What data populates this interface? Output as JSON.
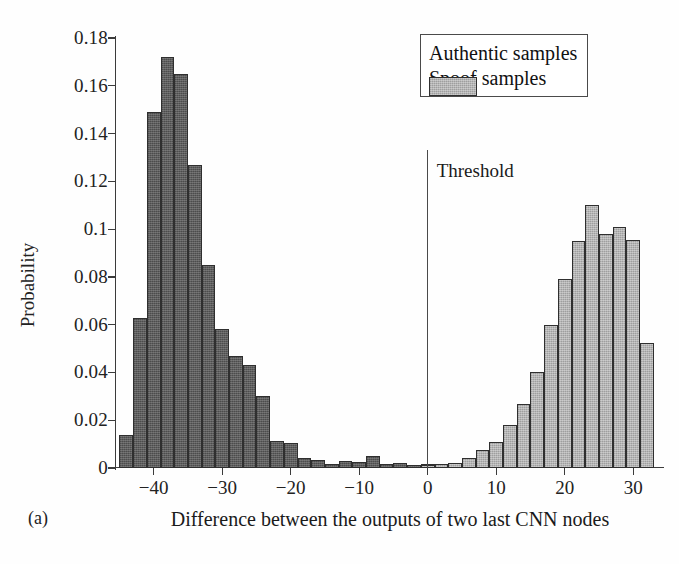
{
  "figure": {
    "panel_tag": "(a)",
    "xlabel": "Difference between the outputs of two last CNN nodes",
    "ylabel": "Probability",
    "threshold_label": "Threshold"
  },
  "legend": {
    "position": "top-right",
    "entries": [
      {
        "label": "Authentic samples",
        "color": "#5d5d5d"
      },
      {
        "label": "Spoof samples",
        "color": "#b4b4b4"
      }
    ]
  },
  "axes": {
    "x_ticks": [
      "−40",
      "−30",
      "−20",
      "−10",
      "0",
      "10",
      "20",
      "30"
    ],
    "x_tick_values": [
      -40,
      -30,
      -20,
      -10,
      0,
      10,
      20,
      30
    ],
    "y_ticks": [
      "0",
      "0.02",
      "0.04",
      "0.06",
      "0.08",
      "0.1",
      "0.12",
      "0.14",
      "0.16",
      "0.18"
    ],
    "y_tick_values": [
      0,
      0.02,
      0.04,
      0.06,
      0.08,
      0.1,
      0.12,
      0.14,
      0.16,
      0.18
    ],
    "xlim": [
      -45.5,
      34.5
    ],
    "ylim": [
      0,
      0.18
    ],
    "grid": false
  },
  "chart_data": {
    "type": "bar",
    "title": "",
    "subtitle": "",
    "xlabel": "Difference between the outputs of two last CNN nodes",
    "ylabel": "Probability",
    "xlim": [
      -45.5,
      34.5
    ],
    "ylim": [
      0,
      0.18
    ],
    "grid": false,
    "legend_position": "top-right",
    "bin_width": 2,
    "annotations": [
      {
        "text": "Threshold",
        "x": 0,
        "type": "vertical-line"
      },
      {
        "text": "(a)",
        "type": "panel-tag"
      }
    ],
    "series": [
      {
        "name": "Authentic samples",
        "color": "#5d5d5d",
        "bin_centers": [
          -44,
          -42,
          -40,
          -38,
          -36,
          -34,
          -32,
          -30,
          -28,
          -26,
          -24,
          -22,
          -20,
          -18,
          -16,
          -14,
          -12,
          -10,
          -8,
          -6,
          -4,
          -2,
          0
        ],
        "values": [
          0.014,
          0.063,
          0.149,
          0.172,
          0.165,
          0.127,
          0.085,
          0.058,
          0.047,
          0.043,
          0.03,
          0.0115,
          0.0105,
          0.004,
          0.0035,
          0.0015,
          0.003,
          0.0025,
          0.005,
          0.0015,
          0.002,
          0.0012,
          0.0015
        ]
      },
      {
        "name": "Spoof samples",
        "color": "#b4b4b4",
        "bin_centers": [
          0,
          2,
          4,
          6,
          8,
          10,
          12,
          14,
          16,
          18,
          20,
          22,
          24,
          26,
          28,
          30,
          32
        ],
        "values": [
          0.0012,
          0.0015,
          0.0022,
          0.004,
          0.0075,
          0.011,
          0.018,
          0.027,
          0.04,
          0.06,
          0.079,
          0.095,
          0.11,
          0.098,
          0.101,
          0.0955,
          0.0525
        ]
      }
    ]
  }
}
